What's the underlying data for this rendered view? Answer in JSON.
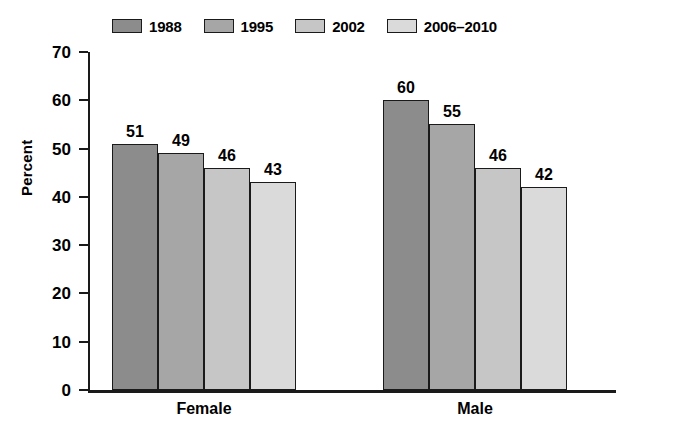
{
  "chart_data": {
    "type": "bar",
    "title": "",
    "xlabel": "",
    "ylabel": "Percent",
    "ylim": [
      0,
      70
    ],
    "yticks": [
      0,
      10,
      20,
      30,
      40,
      50,
      60,
      70
    ],
    "grid": false,
    "legend_position": "top-left",
    "categories": [
      "Female",
      "Male"
    ],
    "series": [
      {
        "name": "1988",
        "values": [
          51,
          60
        ],
        "color": "#8c8c8c"
      },
      {
        "name": "1995",
        "values": [
          49,
          55
        ],
        "color": "#a6a6a6"
      },
      {
        "name": "2002",
        "values": [
          46,
          46
        ],
        "color": "#c6c6c6"
      },
      {
        "name": "2006–2010",
        "values": [
          43,
          42
        ],
        "color": "#dadada"
      }
    ]
  },
  "legend": {
    "items": [
      {
        "label": "1988"
      },
      {
        "label": "1995"
      },
      {
        "label": "2002"
      },
      {
        "label": "2006–2010"
      }
    ]
  },
  "axes": {
    "y_title": "Percent",
    "y_tick_labels": [
      "70",
      "60",
      "50",
      "40",
      "30",
      "20",
      "10",
      "0"
    ],
    "x_tick_labels": [
      "Female",
      "Male"
    ]
  },
  "bar_labels": {
    "female": [
      "51",
      "49",
      "46",
      "43"
    ],
    "male": [
      "60",
      "55",
      "46",
      "42"
    ]
  },
  "colors": {
    "axis": "#1a1a1a",
    "bar_border": "#1a1a1a",
    "background": "#ffffff"
  }
}
